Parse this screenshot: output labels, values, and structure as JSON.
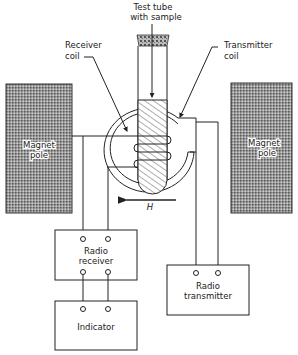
{
  "diagram": {
    "labels": {
      "test_tube_line1": "Test tube",
      "test_tube_line2": "with sample",
      "receiver_coil_line1": "Receiver",
      "receiver_coil_line2": "coil",
      "transmitter_coil_line1": "Transmitter",
      "transmitter_coil_line2": "coil",
      "magnet_left_line1": "Magnet",
      "magnet_left_line2": "pole",
      "magnet_right_line1": "Magnet",
      "magnet_right_line2": "pole",
      "field_label": "H"
    },
    "boxes": {
      "receiver_line1": "Radio",
      "receiver_line2": "receiver",
      "transmitter_line1": "Radio",
      "transmitter_line2": "transmitter",
      "indicator": "Indicator"
    },
    "colors": {
      "magnet_fill": "#8a8a8a",
      "line": "#222222",
      "background": "#ffffff"
    }
  }
}
